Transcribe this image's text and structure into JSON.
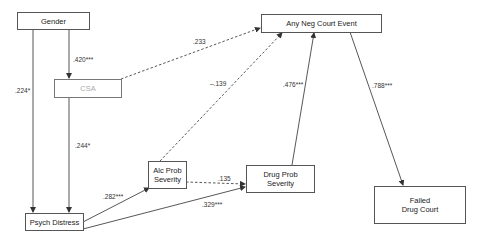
{
  "diagram": {
    "type": "path-model",
    "nodes": [
      {
        "id": "gender",
        "label": "Gender"
      },
      {
        "id": "csa",
        "label": "CSA"
      },
      {
        "id": "any_neg",
        "label": "Any Neg Court Event"
      },
      {
        "id": "alc",
        "label": "Alc Prob\nSeverity"
      },
      {
        "id": "drug",
        "label": "Drug Prob\nSeverity"
      },
      {
        "id": "failed",
        "label": "Failed\nDrug Court"
      },
      {
        "id": "psych",
        "label": "Psych Distress"
      }
    ],
    "edges": [
      {
        "from": "gender",
        "to": "psych",
        "coef": ".224*",
        "style": "solid"
      },
      {
        "from": "gender",
        "to": "csa",
        "coef": ".420***",
        "style": "solid"
      },
      {
        "from": "csa",
        "to": "psych",
        "coef": ".244*",
        "style": "solid"
      },
      {
        "from": "csa",
        "to": "any_neg",
        "coef": ".233",
        "style": "dashed"
      },
      {
        "from": "alc",
        "to": "any_neg",
        "coef": "–.139",
        "style": "dashed"
      },
      {
        "from": "psych",
        "to": "alc",
        "coef": ".282***",
        "style": "solid"
      },
      {
        "from": "alc",
        "to": "drug",
        "coef": ".135",
        "style": "dashed"
      },
      {
        "from": "psych",
        "to": "drug",
        "coef": ".329***",
        "style": "solid"
      },
      {
        "from": "drug",
        "to": "any_neg",
        "coef": ".476***",
        "style": "solid"
      },
      {
        "from": "any_neg",
        "to": "failed",
        "coef": ".788***",
        "style": "solid"
      }
    ]
  }
}
